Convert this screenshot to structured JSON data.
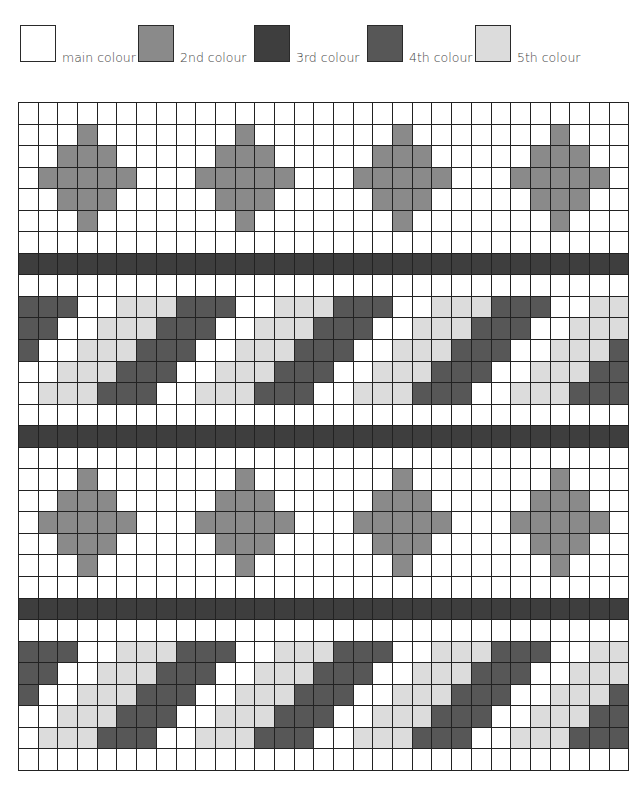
{
  "legend": {
    "items": [
      {
        "label": "main colour",
        "color": "#ffffff",
        "left": 20
      },
      {
        "label": "2nd colour",
        "color": "#8a8a8a",
        "left": 138
      },
      {
        "label": "3rd colour",
        "color": "#3e3e3e",
        "left": 254
      },
      {
        "label": "4th colour",
        "color": "#575757",
        "left": 367
      },
      {
        "label": "5th colour",
        "color": "#dcdcdc",
        "left": 475
      }
    ]
  },
  "chart": {
    "columns": 31,
    "rows": 31,
    "palette": [
      "#ffffff",
      "#8a8a8a",
      "#3e3e3e",
      "#575757",
      "#dcdcdc"
    ],
    "grid": [
      "0000000000000000000000000000000",
      "0001000000010000000100000001000",
      "0011100000111000001110000011100",
      "0111110001111100011111000111110",
      "0011100000111000001110000011100",
      "0001000000010000000100000001000",
      "0000000000000000000000000000000",
      "2222222222222222222222222222222",
      "0000000000000000000000000000000",
      "3330044433300444333004443330044",
      "3300444333004443330044433300444",
      "3004443330044433300444333004443",
      "0044433300444333004443330044433",
      "0444333004443330044433300444333",
      "0000000000000000000000000000000",
      "2222222222222222222222222222222",
      "0000000000000000000000000000000",
      "0001000000010000000100000001000",
      "0011100000111000001110000011100",
      "0111110001111100011111000111110",
      "0011100000111000001110000011100",
      "0001000000010000000100000001000",
      "0000000000000000000000000000000",
      "2222222222222222222222222222222",
      "0000000000000000000000000000000",
      "3330044433300444333004443330044",
      "3300444333004443330044433300444",
      "3004443330044433300444333004443",
      "0044433300444333004443330044433",
      "0444333004443330044433300444333",
      "0000000000000000000000000000000"
    ]
  }
}
